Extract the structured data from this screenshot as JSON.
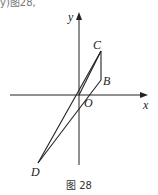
{
  "header_fragment": "y)图28,",
  "axes": {
    "x_label": "x",
    "y_label": "y"
  },
  "points": {
    "C": "C",
    "B": "B",
    "O": "O",
    "D": "D"
  },
  "caption": "图 28",
  "colors": {
    "stroke": "#222222",
    "background": "#ffffff"
  }
}
